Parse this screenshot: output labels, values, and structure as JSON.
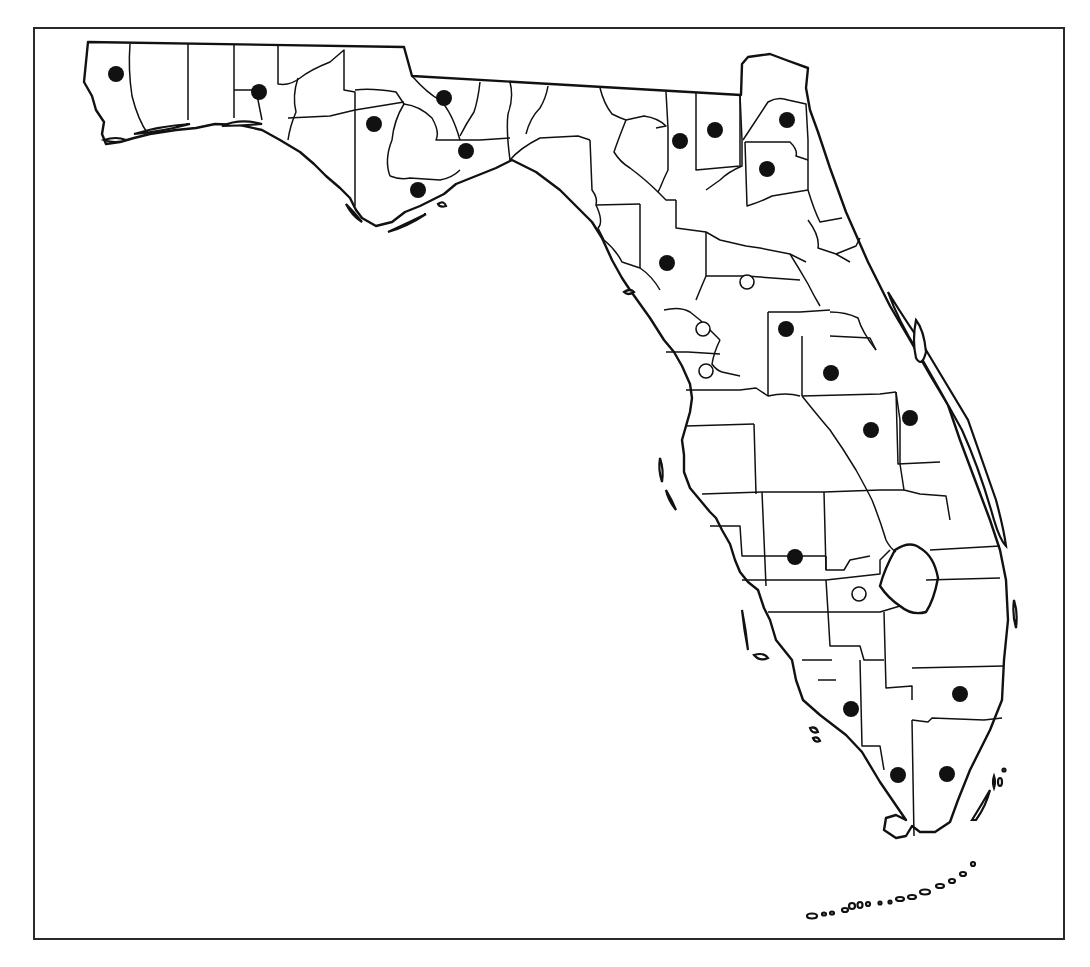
{
  "figure": {
    "caption": "",
    "legend": {
      "filled_circle": "record (filled)",
      "open_circle": "record (open)"
    }
  },
  "colors": {
    "line": "#111111",
    "background": "#ffffff",
    "frame": "#2a2a2a"
  },
  "markers": {
    "filled": [
      {
        "x": 116,
        "y": 74
      },
      {
        "x": 259,
        "y": 92
      },
      {
        "x": 374,
        "y": 124
      },
      {
        "x": 444,
        "y": 98
      },
      {
        "x": 466,
        "y": 151
      },
      {
        "x": 418,
        "y": 190
      },
      {
        "x": 680,
        "y": 141
      },
      {
        "x": 715,
        "y": 130
      },
      {
        "x": 787,
        "y": 120
      },
      {
        "x": 767,
        "y": 169
      },
      {
        "x": 667,
        "y": 263
      },
      {
        "x": 786,
        "y": 329
      },
      {
        "x": 831,
        "y": 373
      },
      {
        "x": 871,
        "y": 430
      },
      {
        "x": 910,
        "y": 418
      },
      {
        "x": 795,
        "y": 557
      },
      {
        "x": 851,
        "y": 709
      },
      {
        "x": 960,
        "y": 694
      },
      {
        "x": 898,
        "y": 775
      },
      {
        "x": 947,
        "y": 774
      }
    ],
    "open": [
      {
        "x": 747,
        "y": 282
      },
      {
        "x": 703,
        "y": 329
      },
      {
        "x": 706,
        "y": 371
      },
      {
        "x": 859,
        "y": 594
      }
    ]
  }
}
